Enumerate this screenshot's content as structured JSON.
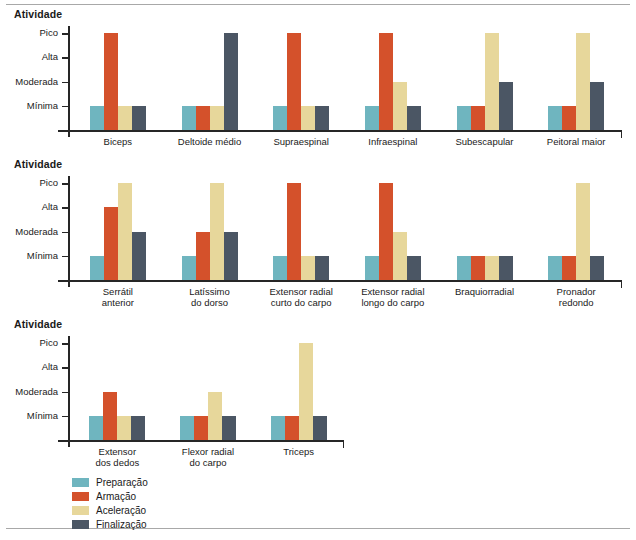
{
  "figure": {
    "axis_title": "Atividade",
    "y_ticks": [
      "Pico",
      "Alta",
      "Moderada",
      "Mínima"
    ]
  },
  "legend": {
    "items": [
      {
        "label": "Preparação",
        "color": "#6FB5BF"
      },
      {
        "label": "Armação",
        "color": "#D4512B"
      },
      {
        "label": "Aceleração",
        "color": "#E7D79B"
      },
      {
        "label": "Finalização",
        "color": "#4B5664"
      }
    ]
  },
  "chart_data": [
    {
      "type": "bar",
      "title": "Atividade",
      "xlabel": "",
      "ylabel": "Atividade",
      "ylim": [
        0,
        4
      ],
      "grid": false,
      "legend_position": "bottom",
      "ytick_labels": [
        "Mínima",
        "Moderada",
        "Alta",
        "Pico"
      ],
      "ytick_values": [
        1,
        2,
        3,
        4
      ],
      "categories": [
        "Biceps",
        "Deltoide médio",
        "Supraespinal",
        "Infraespinal",
        "Subescapular",
        "Peitoral maior"
      ],
      "series": [
        {
          "name": "Preparação",
          "color": "#6FB5BF",
          "values": [
            1,
            1,
            1,
            1,
            1,
            1
          ]
        },
        {
          "name": "Armação",
          "color": "#D4512B",
          "values": [
            4,
            1,
            4,
            4,
            1,
            1
          ]
        },
        {
          "name": "Aceleração",
          "color": "#E7D79B",
          "values": [
            1,
            1,
            1,
            2,
            4,
            4
          ]
        },
        {
          "name": "Finalização",
          "color": "#4B5664",
          "values": [
            1,
            4,
            1,
            1,
            2,
            2
          ]
        }
      ]
    },
    {
      "type": "bar",
      "title": "Atividade",
      "xlabel": "",
      "ylabel": "Atividade",
      "ylim": [
        0,
        4
      ],
      "grid": false,
      "legend_position": "bottom",
      "ytick_labels": [
        "Mínima",
        "Moderada",
        "Alta",
        "Pico"
      ],
      "ytick_values": [
        1,
        2,
        3,
        4
      ],
      "categories": [
        "Serrátil\nanterior",
        "Latíssimo\ndo dorso",
        "Extensor radial\ncurto do carpo",
        "Extensor radial\nlongo do carpo",
        "Braquiorradial",
        "Pronador\nredondo"
      ],
      "series": [
        {
          "name": "Preparação",
          "color": "#6FB5BF",
          "values": [
            1,
            1,
            1,
            1,
            1,
            1
          ]
        },
        {
          "name": "Armação",
          "color": "#D4512B",
          "values": [
            3,
            2,
            4,
            4,
            1,
            1
          ]
        },
        {
          "name": "Aceleração",
          "color": "#E7D79B",
          "values": [
            4,
            4,
            1,
            2,
            1,
            4
          ]
        },
        {
          "name": "Finalização",
          "color": "#4B5664",
          "values": [
            2,
            2,
            1,
            1,
            1,
            1
          ]
        }
      ]
    },
    {
      "type": "bar",
      "title": "Atividade",
      "xlabel": "",
      "ylabel": "Atividade",
      "ylim": [
        0,
        4
      ],
      "grid": false,
      "legend_position": "bottom",
      "ytick_labels": [
        "Mínima",
        "Moderada",
        "Alta",
        "Pico"
      ],
      "ytick_values": [
        1,
        2,
        3,
        4
      ],
      "categories": [
        "Extensor\ndos dedos",
        "Flexor radial\ndo carpo",
        "Triceps"
      ],
      "series": [
        {
          "name": "Preparação",
          "color": "#6FB5BF",
          "values": [
            1,
            1,
            1
          ]
        },
        {
          "name": "Armação",
          "color": "#D4512B",
          "values": [
            2,
            1,
            1
          ]
        },
        {
          "name": "Aceleração",
          "color": "#E7D79B",
          "values": [
            1,
            2,
            4
          ]
        },
        {
          "name": "Finalização",
          "color": "#4B5664",
          "values": [
            1,
            1,
            1
          ]
        }
      ]
    }
  ]
}
